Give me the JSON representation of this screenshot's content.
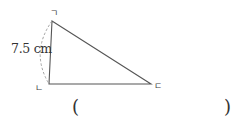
{
  "figure": {
    "type": "triangle",
    "vertices": {
      "top": {
        "label": "ㄱ"
      },
      "bottom_left": {
        "label": "ㄴ"
      },
      "right": {
        "label": "ㄷ"
      }
    },
    "side_length_label": "7.5 cm",
    "stroke_color": "#555555",
    "dashed_arc_color": "#999999"
  },
  "answer": {
    "open_paren": "(",
    "close_paren": ")",
    "value": ""
  }
}
